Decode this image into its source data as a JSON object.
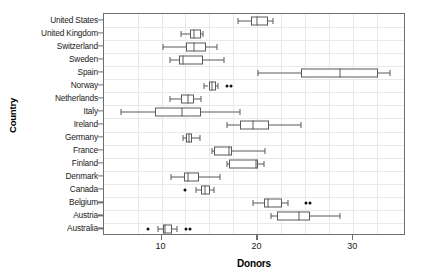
{
  "chart_data": {
    "type": "box",
    "title": "",
    "xlabel": "Donors",
    "ylabel": "Country",
    "xlim": [
      4.0,
      35.5
    ],
    "xticks": [
      10,
      20,
      30
    ],
    "xtick_labels": [
      "10",
      "20",
      "30"
    ],
    "grid": "both-light",
    "legend": "none",
    "orientation": "horizontal",
    "categories": [
      "United States",
      "United Kingdom",
      "Switzerland",
      "Sweden",
      "Spain",
      "Norway",
      "Netherlands",
      "Italy",
      "Ireland",
      "Germany",
      "France",
      "Finland",
      "Denmark",
      "Canada",
      "Belgium",
      "Austria",
      "Australia"
    ],
    "boxes": [
      {
        "category": "United States",
        "whisker_low": 18.0,
        "q1": 19.3,
        "median": 20.0,
        "q3": 21.1,
        "whisker_high": 21.6,
        "outliers": []
      },
      {
        "category": "United Kingdom",
        "whisker_low": 12.0,
        "q1": 13.0,
        "median": 13.4,
        "q3": 14.1,
        "whisker_high": 14.3,
        "outliers": []
      },
      {
        "category": "Switzerland",
        "whisker_low": 10.2,
        "q1": 12.6,
        "median": 13.4,
        "q3": 14.6,
        "whisker_high": 15.8,
        "outliers": []
      },
      {
        "category": "Sweden",
        "whisker_low": 10.9,
        "q1": 11.8,
        "median": 12.2,
        "q3": 14.3,
        "whisker_high": 16.5,
        "outliers": []
      },
      {
        "category": "Spain",
        "whisker_low": 20.1,
        "q1": 24.5,
        "median": 28.6,
        "q3": 32.6,
        "whisker_high": 33.8,
        "outliers": []
      },
      {
        "category": "Norway",
        "whisker_low": 14.4,
        "q1": 14.9,
        "median": 15.3,
        "q3": 15.7,
        "whisker_high": 15.9,
        "outliers": [
          16.8,
          17.2
        ]
      },
      {
        "category": "Netherlands",
        "whisker_low": 10.9,
        "q1": 12.0,
        "median": 12.8,
        "q3": 13.4,
        "whisker_high": 14.1,
        "outliers": []
      },
      {
        "category": "Italy",
        "whisker_low": 5.8,
        "q1": 9.3,
        "median": 12.1,
        "q3": 14.1,
        "whisker_high": 18.2,
        "outliers": []
      },
      {
        "category": "Ireland",
        "whisker_low": 16.8,
        "q1": 18.2,
        "median": 19.5,
        "q3": 21.2,
        "whisker_high": 24.5,
        "outliers": []
      },
      {
        "category": "Germany",
        "whisker_low": 12.2,
        "q1": 12.6,
        "median": 12.9,
        "q3": 13.2,
        "whisker_high": 14.0,
        "outliers": []
      },
      {
        "category": "France",
        "whisker_low": 15.3,
        "q1": 15.5,
        "median": 17.0,
        "q3": 17.4,
        "whisker_high": 20.8,
        "outliers": []
      },
      {
        "category": "Finland",
        "whisker_low": 16.8,
        "q1": 17.0,
        "median": 19.9,
        "q3": 20.1,
        "whisker_high": 20.7,
        "outliers": []
      },
      {
        "category": "Denmark",
        "whisker_low": 11.0,
        "q1": 12.3,
        "median": 12.8,
        "q3": 13.9,
        "whisker_high": 16.1,
        "outliers": []
      },
      {
        "category": "Canada",
        "whisker_low": 13.6,
        "q1": 14.1,
        "median": 14.5,
        "q3": 15.1,
        "whisker_high": 15.5,
        "outliers": [
          12.5
        ]
      },
      {
        "category": "Belgium",
        "whisker_low": 19.5,
        "q1": 20.7,
        "median": 21.1,
        "q3": 22.6,
        "whisker_high": 23.2,
        "outliers": [
          25.1,
          25.5
        ]
      },
      {
        "category": "Austria",
        "whisker_low": 21.4,
        "q1": 22.0,
        "median": 24.3,
        "q3": 25.5,
        "whisker_high": 28.6,
        "outliers": []
      },
      {
        "category": "Australia",
        "whisker_low": 9.6,
        "q1": 10.2,
        "median": 10.4,
        "q3": 11.1,
        "whisker_high": 11.6,
        "outliers": [
          8.6,
          12.6,
          13.0
        ]
      }
    ]
  }
}
